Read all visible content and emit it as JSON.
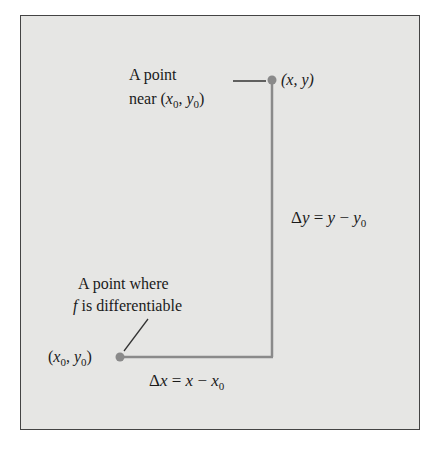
{
  "diagram": {
    "type": "increment-diagram",
    "frame_color": "#e6e6e4",
    "line_color": "#888888",
    "point_color": "#888888",
    "labels": {
      "near_point_line1": "A point",
      "near_point_line2_prefix": "near (",
      "near_point_x": "x",
      "near_point_sub0": "0",
      "near_point_sep": ", ",
      "near_point_y": "y",
      "near_point_sub1": "0",
      "near_point_close": ")",
      "point_xy": "(x, y)",
      "diff_line1": "A point where",
      "diff_f": "f",
      "diff_line2": " is differentiable",
      "base_open": "(",
      "base_x": "x",
      "base_sub0": "0",
      "base_sep": ", ",
      "base_y": "y",
      "base_sub1": "0",
      "base_close": ")",
      "dy_delta": "Δ",
      "dy_var": "y",
      "dy_eq": " = ",
      "dy_rhs_y": "y",
      "dy_minus": " − ",
      "dy_rhs_y0": "y",
      "dy_sub": "0",
      "dx_delta": "Δ",
      "dx_var": "x",
      "dx_eq": " = ",
      "dx_rhs_x": "x",
      "dx_minus": " − ",
      "dx_rhs_x0": "x",
      "dx_sub": "0"
    },
    "points": [
      {
        "name": "base-point",
        "label": "(x0, y0)",
        "px": [
          119,
          357
        ]
      },
      {
        "name": "near-point",
        "label": "(x, y)",
        "px": [
          271,
          80
        ]
      }
    ]
  }
}
